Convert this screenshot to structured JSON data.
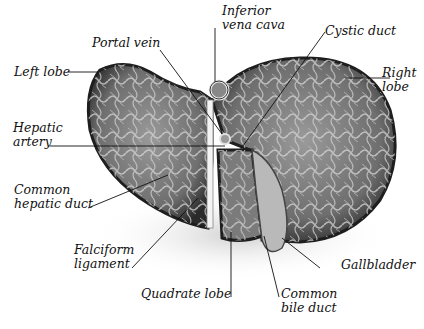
{
  "diagram": {
    "background": "#ffffff",
    "organ_colors": {
      "outline": "#222222",
      "surface": "#8a8a8a",
      "vessel": "#d8d8d8",
      "shadow": "#555555"
    }
  },
  "labels": {
    "inferior_vena_cava": {
      "line1": "Inferior",
      "line2": "vena cava"
    },
    "portal_vein": {
      "line1": "Portal vein"
    },
    "cystic_duct": {
      "line1": "Cystic duct"
    },
    "left_lobe": {
      "line1": "Left lobe"
    },
    "right_lobe": {
      "line1": "Right",
      "line2": "lobe"
    },
    "hepatic_artery": {
      "line1": "Hepatic",
      "line2": "artery"
    },
    "common_hepatic_duct": {
      "line1": "Common",
      "line2": "hepatic duct"
    },
    "falciform_ligament": {
      "line1": "Falciform",
      "line2": "ligament"
    },
    "gallbladder": {
      "line1": "Gallbladder"
    },
    "quadrate_lobe": {
      "line1": "Quadrate lobe"
    },
    "common_bile_duct": {
      "line1": "Common",
      "line2": "bile duct"
    }
  }
}
